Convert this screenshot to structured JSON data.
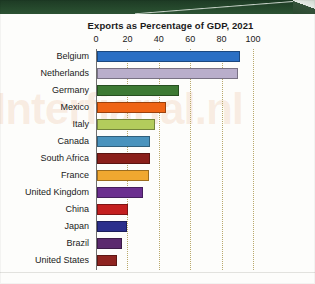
{
  "page": {
    "watermark_text": "Interfiarial.nl",
    "banner_name": "green-photo-band"
  },
  "chart_data": {
    "type": "bar",
    "orientation": "horizontal",
    "title": "Exports as Percentage of GDP, 2021",
    "xlabel": "",
    "ylabel": "",
    "xlim": [
      0,
      100
    ],
    "ticks": [
      "0",
      "20",
      "40",
      "60",
      "80",
      "100"
    ],
    "tick_values": [
      0,
      20,
      40,
      60,
      80,
      100
    ],
    "grid": true,
    "grid_axis": "x",
    "legend": false,
    "categories": [
      "Belgium",
      "Netherlands",
      "Germany",
      "Mexico",
      "Italy",
      "Canada",
      "South Africa",
      "France",
      "United Kingdom",
      "China",
      "Japan",
      "Brazil",
      "United States"
    ],
    "values": [
      91,
      90,
      52,
      44,
      37,
      34,
      34,
      33,
      29,
      20,
      19,
      16,
      13
    ],
    "colors": [
      "#2a6fc4",
      "#b9aecb",
      "#3d7a34",
      "#ef6415",
      "#b3cc5c",
      "#4a93bd",
      "#8a1f1a",
      "#f0a830",
      "#6b2f8f",
      "#c41f1f",
      "#2b2f8c",
      "#5b2a6e",
      "#8f2420"
    ],
    "bars": [
      {
        "label": "Belgium",
        "value": 91,
        "color": "#2a6fc4"
      },
      {
        "label": "Netherlands",
        "value": 90,
        "color": "#b9aecb"
      },
      {
        "label": "Germany",
        "value": 52,
        "color": "#3d7a34"
      },
      {
        "label": "Mexico",
        "value": 44,
        "color": "#ef6415"
      },
      {
        "label": "Italy",
        "value": 37,
        "color": "#b3cc5c"
      },
      {
        "label": "Canada",
        "value": 34,
        "color": "#4a93bd"
      },
      {
        "label": "South Africa",
        "value": 34,
        "color": "#8a1f1a"
      },
      {
        "label": "France",
        "value": 33,
        "color": "#f0a830"
      },
      {
        "label": "United Kingdom",
        "value": 29,
        "color": "#6b2f8f"
      },
      {
        "label": "China",
        "value": 20,
        "color": "#c41f1f"
      },
      {
        "label": "Japan",
        "value": 19,
        "color": "#2b2f8c"
      },
      {
        "label": "Brazil",
        "value": 16,
        "color": "#5b2a6e"
      },
      {
        "label": "United States",
        "value": 13,
        "color": "#8f2420"
      }
    ],
    "gridline_color": "#b9a96b",
    "axis_color": "#6f6f6f"
  }
}
